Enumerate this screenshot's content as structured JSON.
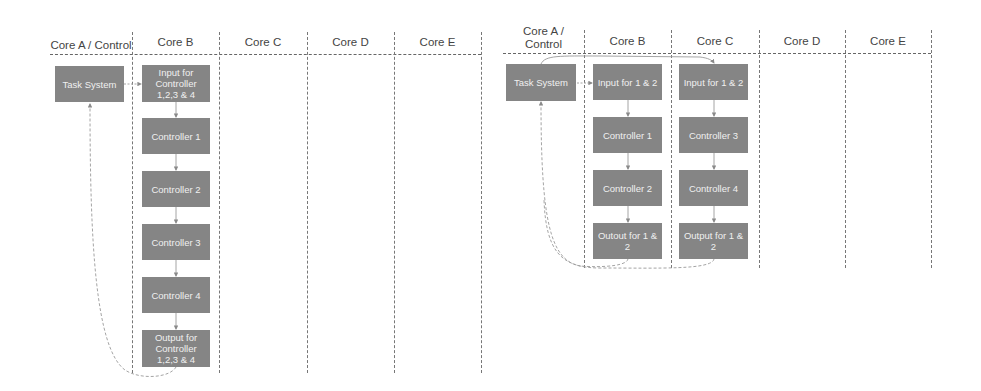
{
  "left": {
    "headers": [
      "Core A / Control",
      "Core B",
      "Core C",
      "Core D",
      "Core E"
    ],
    "task_system": "Task System",
    "core_b": [
      "Input for Controller 1,2,3 & 4",
      "Controller 1",
      "Controller 2",
      "Controller 3",
      "Controller 4",
      "Output for Controller 1,2,3 & 4"
    ]
  },
  "right": {
    "headers": [
      "Core A / Control",
      "Core B",
      "Core C",
      "Core D",
      "Core E"
    ],
    "task_system": "Task System",
    "core_b": [
      "Input for 1 & 2",
      "Controller 1",
      "Controller 2",
      "Outout for 1 & 2"
    ],
    "core_c": [
      "Input for 1 & 2",
      "Controller 3",
      "Controller 4",
      "Output for 1 & 2"
    ]
  },
  "colors": {
    "box": "#858585",
    "box_text": "#f0f0f0",
    "lines": "#777777"
  }
}
